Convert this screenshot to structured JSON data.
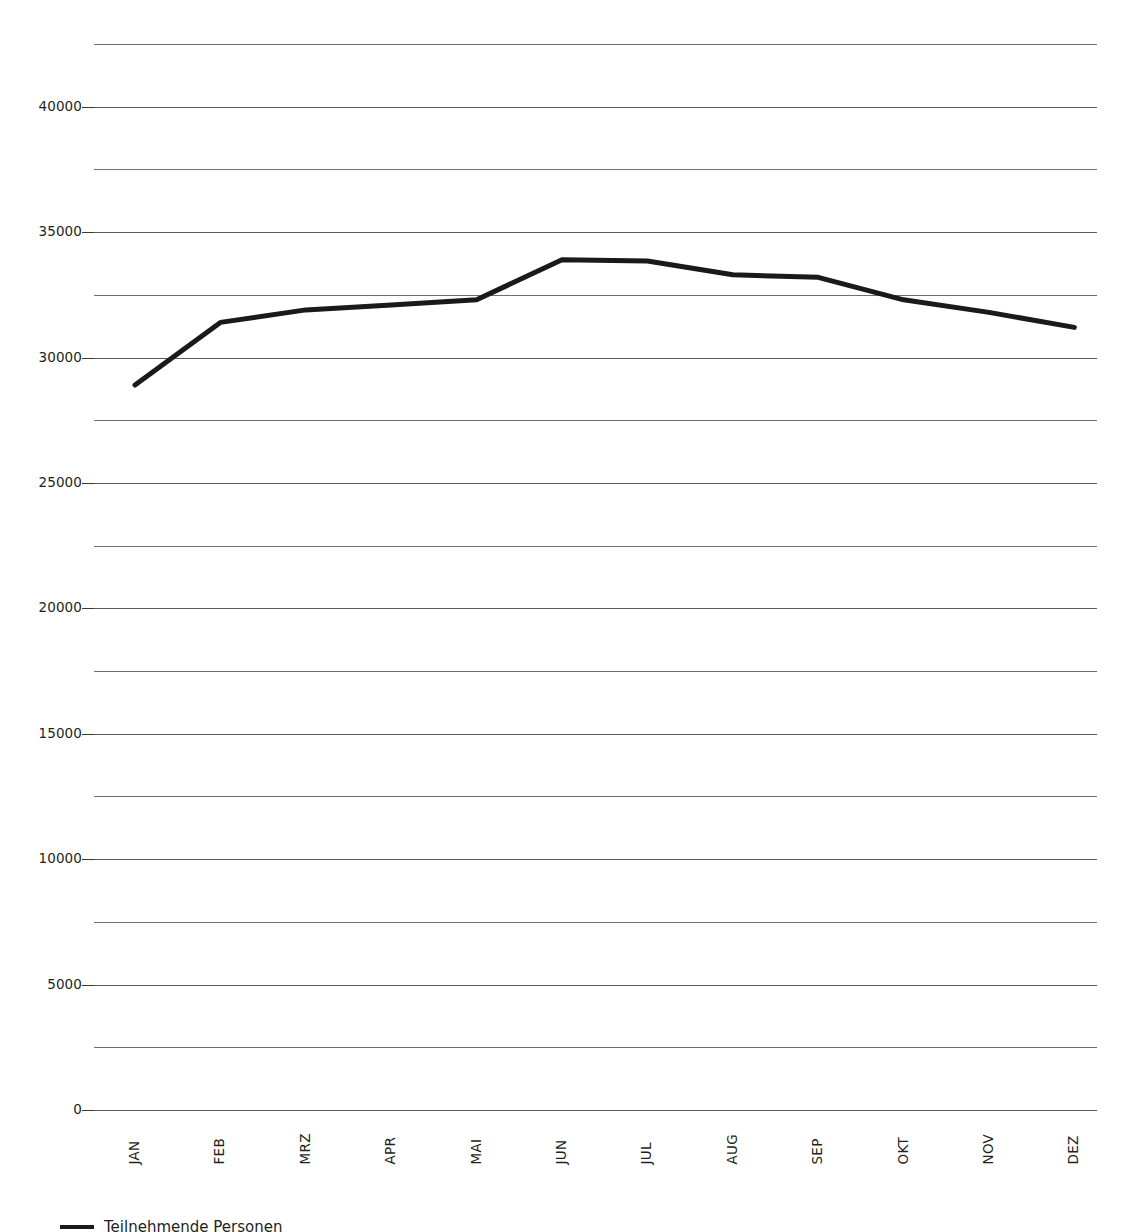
{
  "chart_data": {
    "type": "line",
    "title": "",
    "subtitle": "",
    "xlabel": "",
    "ylabel": "",
    "categories": [
      "JAN",
      "FEB",
      "MRZ",
      "APR",
      "MAI",
      "JUN",
      "JUL",
      "AUG",
      "SEP",
      "OKT",
      "NOV",
      "DEZ"
    ],
    "series": [
      {
        "name": "Teilnehmende Personen",
        "color": "#1a1a1a",
        "values": [
          28900,
          31400,
          31900,
          32100,
          32300,
          33900,
          33850,
          33300,
          33200,
          32300,
          31800,
          31200
        ]
      }
    ],
    "ylim": [
      0,
      42500
    ],
    "ytick_values": [
      0,
      5000,
      10000,
      15000,
      20000,
      25000,
      30000,
      35000,
      40000
    ],
    "ytick_labels": [
      "0",
      "5000",
      "10000",
      "15000",
      "20000",
      "25000",
      "30000",
      "35000",
      "40000"
    ],
    "gridline_values": [
      0,
      2500,
      5000,
      7500,
      10000,
      12500,
      15000,
      17500,
      20000,
      22500,
      25000,
      27500,
      30000,
      32500,
      35000,
      37500,
      40000,
      42500
    ],
    "grid": true,
    "grid_color": "#6f6f6f",
    "legend_position": "bottom-left",
    "background": "#ffffff",
    "line_width": 5
  },
  "legend": {
    "entries": [
      {
        "label": "Teilnehmende Personen",
        "color": "#1a1a1a"
      }
    ]
  }
}
